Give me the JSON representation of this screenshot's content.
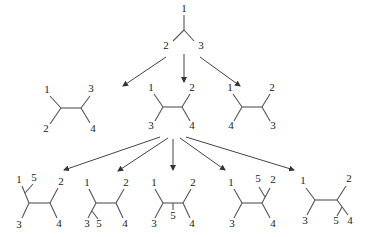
{
  "levels": [
    {
      "name": "three-taxon tree",
      "trees": [
        {
          "labels": [
            "1",
            "2",
            "3"
          ]
        }
      ]
    },
    {
      "name": "four-taxon trees",
      "trees": [
        {
          "labels": {
            "top_left": "1",
            "top_right": "3",
            "bottom_left": "2",
            "bottom_right": "4"
          }
        },
        {
          "labels": {
            "top_left": "1",
            "top_right": "2",
            "bottom_left": "3",
            "bottom_right": "4"
          }
        },
        {
          "labels": {
            "top_left": "1",
            "top_right": "2",
            "bottom_left": "4",
            "bottom_right": "3"
          }
        }
      ]
    },
    {
      "name": "five-taxon trees",
      "trees": [
        {
          "labels": {
            "top_left": "1",
            "added": "5",
            "top_right": "2",
            "bottom_left": "3",
            "bottom_right": "4"
          },
          "added_on": "branch-1"
        },
        {
          "labels": {
            "top_left": "1",
            "top_right": "2",
            "bottom_left": "3",
            "added": "5",
            "bottom_right": "4"
          },
          "added_on": "branch-3"
        },
        {
          "labels": {
            "top_left": "1",
            "top_right": "2",
            "bottom_left": "3",
            "added": "5",
            "bottom_right": "4"
          },
          "added_on": "internal"
        },
        {
          "labels": {
            "top_left": "1",
            "added": "5",
            "top_right": "2",
            "bottom_left": "3",
            "bottom_right": "4"
          },
          "added_on": "branch-2"
        },
        {
          "labels": {
            "top_left": "1",
            "top_right": "2",
            "bottom_left": "3",
            "added": "5",
            "bottom_right": "4"
          },
          "added_on": "branch-4"
        }
      ]
    }
  ],
  "t0": {
    "a": "1",
    "b": "2",
    "c": "3"
  },
  "m1": {
    "tl": "1",
    "tr": "3",
    "bl": "2",
    "br": "4"
  },
  "m2": {
    "tl": "1",
    "tr": "2",
    "bl": "3",
    "br": "4"
  },
  "m3": {
    "tl": "1",
    "tr": "2",
    "bl": "4",
    "br": "3"
  },
  "b1": {
    "tl": "1",
    "x": "5",
    "tr": "2",
    "bl": "3",
    "br": "4"
  },
  "b2": {
    "tl": "1",
    "tr": "2",
    "bl": "3",
    "x": "5",
    "br": "4"
  },
  "b3": {
    "tl": "1",
    "tr": "2",
    "bl": "3",
    "x": "5",
    "br": "4"
  },
  "b4": {
    "tl": "1",
    "x": "5",
    "tr": "2",
    "bl": "3",
    "br": "4"
  },
  "b5": {
    "tl": "1",
    "tr": "2",
    "bl": "3",
    "x": "5",
    "br": "4"
  },
  "colors": {
    "line": "#555555",
    "text": "#222222",
    "background": "#ffffff"
  }
}
